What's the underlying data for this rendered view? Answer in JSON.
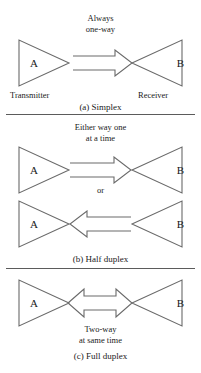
{
  "figure": {
    "line_color": "#6a6a6a",
    "text_color": "#1a1a1a",
    "background": "#ffffff"
  },
  "panels": [
    {
      "id": "simplex",
      "caption": "(a) Simplex",
      "annotation_line1": "Always",
      "annotation_line2": "one-way",
      "left_node": "A",
      "right_node": "B",
      "left_endpoint_label": "Transmitter",
      "right_endpoint_label": "Receiver",
      "arrow_direction": "right"
    },
    {
      "id": "half-duplex",
      "caption": "(b) Half duplex",
      "annotation_line1": "Either way one",
      "annotation_line2": "at a time",
      "connector_word": "or",
      "top_left_node": "A",
      "top_right_node": "B",
      "bottom_left_node": "A",
      "bottom_right_node": "B",
      "top_arrow_direction": "right",
      "bottom_arrow_direction": "left"
    },
    {
      "id": "full-duplex",
      "caption": "(c) Full duplex",
      "annotation_line1": "Two-way",
      "annotation_line2": "at same time",
      "left_node": "A",
      "right_node": "B",
      "arrow_direction": "both"
    }
  ]
}
